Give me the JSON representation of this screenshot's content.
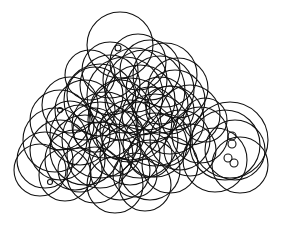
{
  "image": {
    "description": "Abstract drawing of many overlapping black circle outlines on a white background",
    "width": 282,
    "height": 234,
    "background": "#ffffff",
    "stroke_color": "#111111",
    "stroke_width": 1.1,
    "circles": [
      [
        120,
        45,
        33
      ],
      [
        150,
        70,
        30
      ],
      [
        135,
        80,
        32
      ],
      [
        110,
        85,
        30
      ],
      [
        160,
        90,
        34
      ],
      [
        95,
        95,
        28
      ],
      [
        175,
        100,
        30
      ],
      [
        140,
        100,
        35
      ],
      [
        120,
        110,
        30
      ],
      [
        85,
        110,
        30
      ],
      [
        70,
        105,
        28
      ],
      [
        60,
        120,
        30
      ],
      [
        150,
        115,
        28
      ],
      [
        170,
        120,
        34
      ],
      [
        190,
        115,
        30
      ],
      [
        105,
        125,
        33
      ],
      [
        130,
        130,
        30
      ],
      [
        80,
        135,
        30
      ],
      [
        55,
        140,
        32
      ],
      [
        45,
        160,
        28
      ],
      [
        75,
        160,
        30
      ],
      [
        100,
        155,
        33
      ],
      [
        130,
        155,
        30
      ],
      [
        155,
        145,
        32
      ],
      [
        180,
        140,
        30
      ],
      [
        200,
        135,
        28
      ],
      [
        120,
        170,
        30
      ],
      [
        95,
        175,
        28
      ],
      [
        65,
        175,
        26
      ],
      [
        150,
        170,
        30
      ],
      [
        170,
        165,
        28
      ],
      [
        225,
        145,
        35
      ],
      [
        235,
        150,
        30
      ],
      [
        215,
        160,
        32
      ],
      [
        240,
        165,
        28
      ],
      [
        230,
        140,
        38
      ],
      [
        145,
        90,
        40
      ],
      [
        110,
        70,
        28
      ],
      [
        165,
        75,
        32
      ],
      [
        90,
        75,
        25
      ],
      [
        125,
        95,
        38
      ],
      [
        155,
        130,
        36
      ],
      [
        100,
        140,
        38
      ],
      [
        140,
        140,
        38
      ],
      [
        85,
        150,
        35
      ],
      [
        60,
        150,
        30
      ],
      [
        40,
        170,
        26
      ],
      [
        115,
        185,
        28
      ],
      [
        145,
        185,
        26
      ],
      [
        130,
        120,
        42
      ],
      [
        160,
        105,
        28
      ],
      [
        100,
        100,
        36
      ],
      [
        178,
        88,
        30
      ],
      [
        138,
        62,
        28
      ],
      [
        190,
        150,
        26
      ],
      [
        70,
        125,
        24
      ],
      [
        115,
        150,
        26
      ],
      [
        165,
        140,
        26
      ],
      [
        205,
        120,
        22
      ],
      [
        95,
        130,
        22
      ],
      [
        120,
        135,
        24
      ],
      [
        150,
        155,
        22
      ],
      [
        80,
        170,
        22
      ],
      [
        135,
        175,
        22
      ],
      [
        170,
        110,
        24
      ]
    ],
    "small_circles": [
      [
        232,
        136,
        4
      ],
      [
        232,
        144,
        4
      ],
      [
        228,
        158,
        4
      ],
      [
        234,
        163,
        4
      ],
      [
        118,
        48,
        3
      ],
      [
        60,
        110,
        2.5
      ],
      [
        50,
        182,
        2.5
      ]
    ]
  }
}
